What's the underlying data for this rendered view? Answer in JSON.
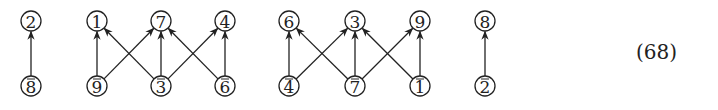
{
  "equation_number": "(68)",
  "node_radius": 10,
  "rows": {
    "top_y": 21,
    "bottom_y": 86
  },
  "nodes": [
    {
      "id": "t2",
      "label": "2",
      "bar": false,
      "x": 31,
      "row": "top"
    },
    {
      "id": "b8",
      "label": "8",
      "bar": true,
      "x": 31,
      "row": "bottom"
    },
    {
      "id": "t1",
      "label": "1",
      "bar": false,
      "x": 97,
      "row": "top"
    },
    {
      "id": "t7",
      "label": "7",
      "bar": false,
      "x": 161,
      "row": "top"
    },
    {
      "id": "t4",
      "label": "4",
      "bar": false,
      "x": 225,
      "row": "top"
    },
    {
      "id": "b9",
      "label": "9",
      "bar": true,
      "x": 97,
      "row": "bottom"
    },
    {
      "id": "b3",
      "label": "3",
      "bar": true,
      "x": 161,
      "row": "bottom"
    },
    {
      "id": "b6",
      "label": "6",
      "bar": true,
      "x": 225,
      "row": "bottom"
    },
    {
      "id": "t6",
      "label": "6",
      "bar": false,
      "x": 289,
      "row": "top"
    },
    {
      "id": "t3",
      "label": "3",
      "bar": false,
      "x": 355,
      "row": "top"
    },
    {
      "id": "t9",
      "label": "9",
      "bar": false,
      "x": 420,
      "row": "top"
    },
    {
      "id": "b4",
      "label": "4",
      "bar": true,
      "x": 289,
      "row": "bottom"
    },
    {
      "id": "b7",
      "label": "7",
      "bar": true,
      "x": 355,
      "row": "bottom"
    },
    {
      "id": "b1",
      "label": "1",
      "bar": true,
      "x": 420,
      "row": "bottom"
    },
    {
      "id": "t8",
      "label": "8",
      "bar": false,
      "x": 485,
      "row": "top"
    },
    {
      "id": "b2",
      "label": "2",
      "bar": true,
      "x": 485,
      "row": "bottom"
    }
  ],
  "edges": [
    [
      "b8",
      "t2"
    ],
    [
      "b9",
      "t1"
    ],
    [
      "b9",
      "t7"
    ],
    [
      "b3",
      "t1"
    ],
    [
      "b3",
      "t7"
    ],
    [
      "b3",
      "t4"
    ],
    [
      "b6",
      "t7"
    ],
    [
      "b6",
      "t4"
    ],
    [
      "b4",
      "t6"
    ],
    [
      "b4",
      "t3"
    ],
    [
      "b7",
      "t6"
    ],
    [
      "b7",
      "t3"
    ],
    [
      "b7",
      "t9"
    ],
    [
      "b1",
      "t3"
    ],
    [
      "b1",
      "t9"
    ],
    [
      "b2",
      "t8"
    ]
  ]
}
